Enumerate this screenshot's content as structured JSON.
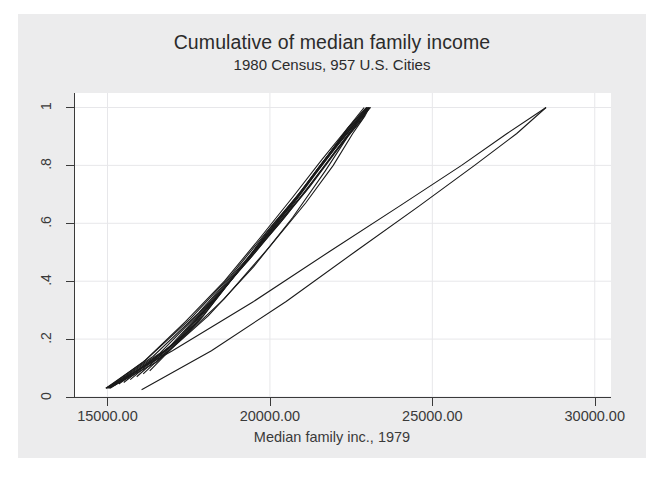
{
  "chart_data": {
    "type": "line",
    "title": "Cumulative of median family income",
    "subtitle": "1980 Census, 957 U.S. Cities",
    "xlabel": "Median family inc., 1979",
    "ylabel": "",
    "xlim": [
      14000,
      30500
    ],
    "ylim": [
      0,
      1.05
    ],
    "grid": true,
    "legend": false,
    "xticks": [
      15000,
      20000,
      25000,
      30000
    ],
    "xtick_labels": [
      "15000.00",
      "20000.00",
      "25000.00",
      "30000.00"
    ],
    "yticks": [
      0,
      0.2,
      0.4,
      0.6,
      0.8,
      1
    ],
    "ytick_labels": [
      "0",
      ".2",
      ".4",
      ".6",
      ".8",
      "1"
    ],
    "line_color": "#1a1a1a",
    "grid_color": "#e7e7ea",
    "axis_color": "#3a3a3a",
    "figure_background": "#ececed",
    "plot_background": "#ffffff",
    "series": [
      {
        "name": "trace-1",
        "x": [
          14950,
          16100,
          17400,
          18600,
          19700,
          20700,
          21600,
          22400,
          22900
        ],
        "y": [
          0.03,
          0.12,
          0.26,
          0.4,
          0.55,
          0.69,
          0.82,
          0.93,
          1.0
        ]
      },
      {
        "name": "trace-2",
        "x": [
          14980,
          16200,
          17550,
          18800,
          19900,
          20900,
          21800,
          22600,
          23050
        ],
        "y": [
          0.03,
          0.13,
          0.27,
          0.42,
          0.57,
          0.7,
          0.83,
          0.94,
          1.0
        ]
      },
      {
        "name": "trace-3",
        "x": [
          15020,
          16400,
          17800,
          19000,
          20100,
          21100,
          21950,
          22700,
          23100
        ],
        "y": [
          0.03,
          0.14,
          0.29,
          0.44,
          0.58,
          0.71,
          0.84,
          0.95,
          1.0
        ]
      },
      {
        "name": "trace-4",
        "x": [
          15100,
          16600,
          18000,
          19200,
          20300,
          21250,
          22050,
          22750,
          23080
        ],
        "y": [
          0.035,
          0.15,
          0.31,
          0.46,
          0.6,
          0.73,
          0.85,
          0.95,
          1.0
        ]
      },
      {
        "name": "trace-5",
        "x": [
          15200,
          16800,
          18200,
          19400,
          20450,
          21350,
          22100,
          22780,
          23060
        ],
        "y": [
          0.04,
          0.16,
          0.33,
          0.48,
          0.62,
          0.75,
          0.86,
          0.96,
          1.0
        ]
      },
      {
        "name": "trace-6",
        "x": [
          15350,
          17000,
          18400,
          19550,
          20550,
          21400,
          22150,
          22800,
          23040
        ],
        "y": [
          0.045,
          0.18,
          0.35,
          0.5,
          0.64,
          0.77,
          0.88,
          0.97,
          1.0
        ]
      },
      {
        "name": "trace-7",
        "x": [
          15500,
          17200,
          18550,
          19650,
          20650,
          21480,
          22200,
          22820,
          23020
        ],
        "y": [
          0.05,
          0.2,
          0.37,
          0.52,
          0.66,
          0.79,
          0.89,
          0.97,
          1.0
        ]
      },
      {
        "name": "trace-8",
        "x": [
          15700,
          17400,
          18700,
          19780,
          20750,
          21550,
          22250,
          22840,
          23000
        ],
        "y": [
          0.06,
          0.22,
          0.39,
          0.54,
          0.68,
          0.8,
          0.9,
          0.98,
          1.0
        ]
      },
      {
        "name": "trace-9",
        "x": [
          15900,
          17600,
          18850,
          19900,
          20850,
          21620,
          22300,
          22860,
          22990
        ],
        "y": [
          0.07,
          0.24,
          0.41,
          0.56,
          0.69,
          0.81,
          0.91,
          0.98,
          1.0
        ]
      },
      {
        "name": "trace-10",
        "x": [
          16100,
          17800,
          19000,
          20020,
          20950,
          21700,
          22350,
          22880,
          22980
        ],
        "y": [
          0.08,
          0.26,
          0.43,
          0.58,
          0.71,
          0.82,
          0.92,
          0.99,
          1.0
        ]
      },
      {
        "name": "trace-11",
        "x": [
          16300,
          17950,
          19120,
          20120,
          21030,
          21760,
          22400,
          22900,
          22975
        ],
        "y": [
          0.09,
          0.28,
          0.45,
          0.6,
          0.72,
          0.83,
          0.93,
          0.99,
          1.0
        ]
      },
      {
        "name": "trace-12",
        "x": [
          15050,
          16500,
          18100,
          19500,
          20700,
          21700,
          22400,
          22850,
          23020
        ],
        "y": [
          0.03,
          0.12,
          0.28,
          0.45,
          0.62,
          0.78,
          0.9,
          0.96,
          1.0
        ]
      },
      {
        "name": "trace-13",
        "x": [
          15080,
          16900,
          18600,
          20000,
          21100,
          21950,
          22550,
          22920,
          23060
        ],
        "y": [
          0.03,
          0.16,
          0.34,
          0.52,
          0.67,
          0.8,
          0.91,
          0.97,
          1.0
        ]
      },
      {
        "name": "outlier-1",
        "x": [
          14950,
          17000,
          19500,
          21800,
          24000,
          25900,
          27300,
          28500
        ],
        "y": [
          0.03,
          0.16,
          0.33,
          0.5,
          0.66,
          0.8,
          0.91,
          1.0
        ]
      },
      {
        "name": "outlier-2",
        "x": [
          16050,
          18200,
          20500,
          22600,
          24600,
          26300,
          27600,
          28500
        ],
        "y": [
          0.025,
          0.16,
          0.33,
          0.5,
          0.66,
          0.8,
          0.91,
          1.0
        ]
      }
    ]
  }
}
